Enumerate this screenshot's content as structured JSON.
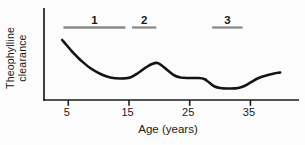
{
  "chart_data": {
    "type": "line",
    "title": "",
    "xlabel": "Age (years)",
    "ylabel": "Theophylline clearance",
    "x_ticks": [
      5,
      15,
      25,
      35
    ],
    "xlim": [
      1,
      43
    ],
    "ylim": [
      0,
      100
    ],
    "y_scale_note": "y-axis has no tick labels; values are relative units (% of axis height)",
    "grid": false,
    "legend": false,
    "series": [
      {
        "name": "theophylline-clearance-curve",
        "points": [
          [
            4.0,
            65.2
          ],
          [
            4.7,
            59.8
          ],
          [
            5.7,
            52.2
          ],
          [
            7.0,
            43.5
          ],
          [
            8.6,
            34.8
          ],
          [
            10.3,
            28.3
          ],
          [
            11.9,
            24.5
          ],
          [
            13.6,
            23.4
          ],
          [
            15.2,
            24.5
          ],
          [
            16.5,
            29.3
          ],
          [
            17.9,
            35.9
          ],
          [
            19.0,
            39.7
          ],
          [
            19.7,
            40.2
          ],
          [
            20.5,
            37.0
          ],
          [
            21.5,
            31.5
          ],
          [
            22.5,
            26.6
          ],
          [
            23.5,
            24.5
          ],
          [
            24.8,
            23.9
          ],
          [
            26.4,
            23.9
          ],
          [
            27.4,
            22.8
          ],
          [
            28.2,
            19.0
          ],
          [
            29.1,
            14.7
          ],
          [
            30.0,
            13.0
          ],
          [
            31.7,
            12.5
          ],
          [
            33.0,
            13.0
          ],
          [
            34.0,
            15.2
          ],
          [
            35.0,
            19.0
          ],
          [
            36.0,
            22.8
          ],
          [
            37.0,
            25.5
          ],
          [
            37.9,
            27.2
          ],
          [
            38.9,
            28.8
          ],
          [
            39.9,
            29.9
          ]
        ]
      }
    ],
    "annotations": [
      {
        "label": "1",
        "age_start": 4.2,
        "age_end": 14.4
      },
      {
        "label": "2",
        "age_start": 15.5,
        "age_end": 19.5
      },
      {
        "label": "3",
        "age_start": 28.7,
        "age_end": 33.7
      }
    ],
    "colors": {
      "curve": "#141414",
      "axis": "#1c1c1c",
      "annotation_bar": "#8a8a8a",
      "text": "#1a1a1a",
      "background": "#fcfcfc"
    }
  }
}
